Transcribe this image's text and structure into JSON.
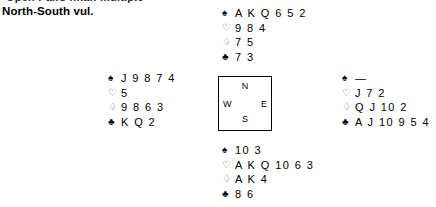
{
  "header": {
    "clipped_line": "Open Pairs final: multiple",
    "vulnerability": "North-South vul."
  },
  "compass": {
    "north_label": "N",
    "south_label": "S",
    "west_label": "W",
    "east_label": "E"
  },
  "suit_symbols": {
    "spade": "♠",
    "heart": "♡",
    "diamond": "♢",
    "club": "♣"
  },
  "void_mark": "—",
  "hands": {
    "north": {
      "position": "North",
      "spades": "A K Q 6 5 2",
      "hearts": "9 8 4",
      "diamonds": "7 5",
      "clubs": "7 3"
    },
    "west": {
      "position": "West",
      "spades": "J 9 8 7 4",
      "hearts": "5",
      "diamonds": "9 8 6 3",
      "clubs": "K Q 2"
    },
    "east": {
      "position": "East",
      "spades": "—",
      "hearts": "J 7 2",
      "diamonds": "Q J 10 2",
      "clubs": "A J 10 9 5 4"
    },
    "south": {
      "position": "South",
      "spades": "10 3",
      "hearts": "A K Q 10 6 3",
      "diamonds": "A K 4",
      "clubs": "8 6"
    }
  }
}
